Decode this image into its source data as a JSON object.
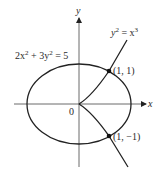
{
  "figure": {
    "type": "diagram",
    "axes": {
      "x_label": "x",
      "y_label": "y",
      "origin_label": "0"
    },
    "curves": [
      {
        "name": "ellipse",
        "equation_label": {
          "a": "2x",
          "a_exp": "2",
          "plus": " + 3y",
          "b_exp": "2",
          "rhs": " = 5"
        }
      },
      {
        "name": "semicubical-parabola",
        "equation_label": {
          "lhs": "y",
          "lhs_exp": "2",
          "mid": " = x",
          "rhs_exp": "3"
        }
      }
    ],
    "points": [
      {
        "label": "(1, 1)",
        "x": 1,
        "y": 1
      },
      {
        "label": "(1, −1)",
        "x": 1,
        "y": -1
      }
    ],
    "colors": {
      "stroke": "#222222",
      "background": "#ffffff"
    }
  }
}
